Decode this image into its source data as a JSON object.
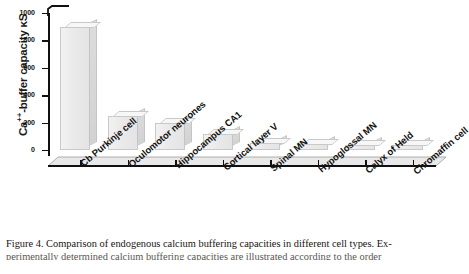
{
  "chart_data": {
    "type": "bar",
    "title": "",
    "xlabel": "",
    "ylabel": "Ca++-buffer capacity κS",
    "ylabel_prefix": "Ca",
    "ylabel_sup": "++",
    "ylabel_suffix": "-buffer capacity κS",
    "ylim": [
      0,
      1000
    ],
    "yticks": [
      0,
      200,
      400,
      600,
      800,
      1000
    ],
    "ytick_labels": [
      "0",
      "200",
      "400",
      "600",
      "800",
      "1000"
    ],
    "grid": false,
    "legend": false,
    "axis_break_top": true,
    "categories": [
      "Cb Purkinje cell",
      "Oculomotor neurones",
      "Hippocampus CA1",
      "Cortical layer V",
      "Spinal MN",
      "Hypoglossal MN",
      "Calyx of Held",
      "Chromaffin cell"
    ],
    "values": [
      900,
      245,
      195,
      120,
      50,
      45,
      40,
      35
    ],
    "bar_style": "3d-block-light-grey",
    "bar_fill": "#ececec",
    "bar_edge": "#c9c9c9"
  },
  "caption": {
    "line1": "Figure 4.  Comparison of endogenous calcium buffering capacities in different cell types. Ex-",
    "line2": "perimentally determined calcium buffering capacities are illustrated according to the order"
  }
}
